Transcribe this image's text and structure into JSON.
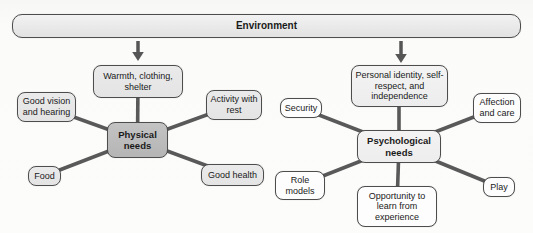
{
  "environment_bar": {
    "label": "Environment"
  },
  "clusters": [
    {
      "name": "physical-needs",
      "center": {
        "label": "Physical needs"
      },
      "satellites": [
        {
          "label": "Warmth, clothing, shelter"
        },
        {
          "label": "Good vision and hearing"
        },
        {
          "label": "Activity with rest"
        },
        {
          "label": "Food"
        },
        {
          "label": "Good health"
        }
      ]
    },
    {
      "name": "psychological-needs",
      "center": {
        "label": "Psychological needs"
      },
      "satellites": [
        {
          "label": "Personal identity, self-respect, and independence"
        },
        {
          "label": "Security"
        },
        {
          "label": "Affection and care"
        },
        {
          "label": "Role models"
        },
        {
          "label": "Opportunity to learn from experience"
        },
        {
          "label": "Play"
        }
      ]
    }
  ],
  "colors": {
    "bar_fill": "#e8e8e8",
    "node_border": "#4d4d4d",
    "left_satellite_fill": "#e4e4e4",
    "physical_center_fill": "#b5b5b5",
    "psychological_center_fill": "#ededed",
    "right_satellite_fill": "#fdfdfd",
    "connector_line": "#595959"
  }
}
